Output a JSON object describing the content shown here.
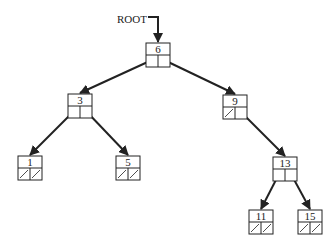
{
  "diagram": {
    "root_label": "ROOT",
    "colors": {
      "stroke": "#222222",
      "background": "#ffffff"
    },
    "nodes": [
      {
        "id": "n6",
        "value": "6",
        "x": 146,
        "y": 43,
        "left": "n3",
        "right": "n9"
      },
      {
        "id": "n3",
        "value": "3",
        "x": 68,
        "y": 94,
        "left": "n1",
        "right": "n5"
      },
      {
        "id": "n9",
        "value": "9",
        "x": 223,
        "y": 95,
        "left": null,
        "right": "n13"
      },
      {
        "id": "n1",
        "value": "1",
        "x": 18,
        "y": 156,
        "left": null,
        "right": null
      },
      {
        "id": "n5",
        "value": "5",
        "x": 116,
        "y": 156,
        "left": null,
        "right": null
      },
      {
        "id": "n13",
        "value": "13",
        "x": 273,
        "y": 157,
        "left": "n11",
        "right": "n15"
      },
      {
        "id": "n11",
        "value": "11",
        "x": 249,
        "y": 210,
        "left": null,
        "right": null
      },
      {
        "id": "n15",
        "value": "15",
        "x": 298,
        "y": 210,
        "left": null,
        "right": null
      }
    ]
  }
}
